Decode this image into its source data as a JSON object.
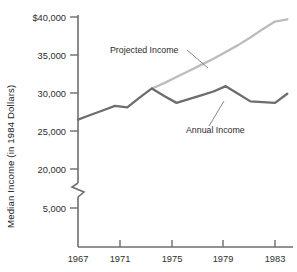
{
  "chart_data": {
    "type": "line",
    "title": "",
    "xlabel": "",
    "ylabel": "Median Income (in 1984 Dollars)",
    "x": [
      1967,
      1968,
      1969,
      1970,
      1971,
      1972,
      1973,
      1974,
      1975,
      1976,
      1977,
      1978,
      1979,
      1980,
      1981,
      1982,
      1983,
      1984
    ],
    "xlim": [
      1967,
      1984
    ],
    "ylim": [
      20000,
      40000
    ],
    "y_axis_break": true,
    "y_axis_break_note": "axis broken between 5,000 and 20,000",
    "grid": false,
    "legend": "inline-annotations",
    "xticks": [
      1967,
      1971,
      1975,
      1979,
      1983
    ],
    "xticklabels": [
      "1967",
      "1971",
      "1975",
      "1979",
      "1983"
    ],
    "yticks": [
      5000,
      20000,
      25000,
      30000,
      35000,
      40000
    ],
    "yticklabels": [
      "5,000",
      "20,000",
      "25,000",
      "30,000",
      "35,000",
      "$40,000"
    ],
    "series": [
      {
        "name": "Annual Income",
        "color": "#6d6d6d",
        "x": [
          1967,
          1968,
          1969,
          1970,
          1971,
          1972,
          1973,
          1974,
          1975,
          1976,
          1977,
          1978,
          1979,
          1980,
          1981,
          1982,
          1983,
          1984
        ],
        "values": [
          26500,
          27100,
          27700,
          28300,
          28100,
          29400,
          30600,
          29600,
          28700,
          29200,
          29700,
          30200,
          30900,
          29900,
          28900,
          28800,
          28700,
          29900
        ]
      },
      {
        "name": "Projected Income",
        "color": "#bcbcbc",
        "x": [
          1973,
          1974,
          1975,
          1976,
          1977,
          1978,
          1979,
          1980,
          1981,
          1982,
          1983,
          1984
        ],
        "values": [
          30600,
          31300,
          32100,
          32900,
          33700,
          34500,
          35400,
          36300,
          37300,
          38400,
          39400,
          39700
        ]
      }
    ],
    "annotations": [
      {
        "name": "Projected Income",
        "label": "Projected Income"
      },
      {
        "name": "Annual Income",
        "label": "Annual Income"
      }
    ]
  },
  "axis": {
    "y_title": "Median Income (in 1984 Dollars)",
    "yticklabels": [
      "$40,000",
      "35,000",
      "30,000",
      "25,000",
      "20,000",
      "5,000"
    ],
    "xticklabels": [
      "1967",
      "1971",
      "1975",
      "1979",
      "1983"
    ]
  },
  "labels": {
    "projected": "Projected Income",
    "annual": "Annual Income"
  },
  "colors": {
    "annual_line": "#6d6d6d",
    "projected_line": "#bcbcbc",
    "axis": "#6e6e6e",
    "text": "#222222",
    "background": "#ffffff"
  }
}
